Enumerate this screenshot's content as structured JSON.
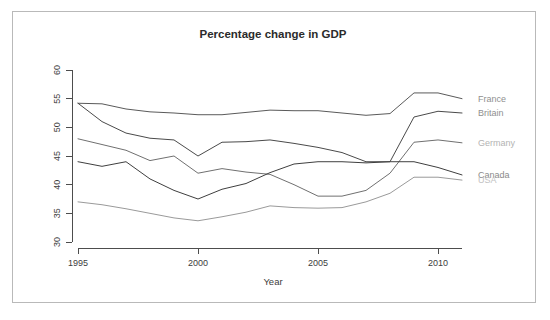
{
  "figure": {
    "background_color": "#ffffff",
    "frame_color": "#b9b9b9",
    "axis_color": "#4d4d4d"
  },
  "chart_data": {
    "type": "line",
    "title": "Percentage change in GDP",
    "xlabel": "Year",
    "ylabel": "",
    "xlim": [
      1995,
      2011
    ],
    "ylim": [
      29,
      61
    ],
    "xticks": [
      1995,
      2000,
      2005,
      2010
    ],
    "yticks": [
      30,
      35,
      40,
      45,
      50,
      55,
      60
    ],
    "grid": false,
    "legend_position": "right-inline",
    "x": [
      1995,
      1996,
      1997,
      1998,
      1999,
      2000,
      2001,
      2002,
      2003,
      2004,
      2005,
      2006,
      2007,
      2008,
      2009,
      2010,
      2011
    ],
    "series": [
      {
        "name": "France",
        "color": "#5a5a5a",
        "label_color": "#8f8f8f",
        "values": [
          54.2,
          54.1,
          53.2,
          52.7,
          52.5,
          52.2,
          52.2,
          52.6,
          53.0,
          52.9,
          52.9,
          52.5,
          52.1,
          52.4,
          56.0,
          56.0,
          55.0
        ]
      },
      {
        "name": "Britain",
        "color": "#4a4a4a",
        "label_color": "#8f8f8f",
        "values": [
          54.2,
          51.0,
          49.0,
          48.1,
          47.8,
          45.0,
          47.4,
          47.5,
          47.8,
          47.2,
          46.5,
          45.6,
          44.0,
          44.0,
          51.8,
          52.8,
          52.5
        ]
      },
      {
        "name": "Germany",
        "color": "#707070",
        "label_color": "#b3b3b3",
        "values": [
          48.0,
          47.0,
          46.0,
          44.2,
          45.0,
          42.0,
          42.8,
          42.2,
          41.8,
          40.0,
          38.0,
          38.0,
          39.0,
          42.0,
          47.4,
          47.8,
          47.3
        ]
      },
      {
        "name": "Canada",
        "color": "#3f3f3f",
        "label_color": "#8a8a8a",
        "values": [
          44.0,
          43.2,
          44.0,
          41.0,
          39.0,
          37.5,
          39.2,
          40.2,
          42.1,
          43.6,
          44.0,
          44.0,
          43.8,
          44.0,
          44.0,
          43.0,
          41.7
        ]
      },
      {
        "name": "USA",
        "color": "#9a9a9a",
        "label_color": "#c2c2c2",
        "values": [
          37.0,
          36.5,
          35.8,
          35.0,
          34.2,
          33.7,
          34.4,
          35.2,
          36.3,
          36.0,
          35.9,
          36.0,
          37.0,
          38.5,
          41.3,
          41.3,
          40.8
        ]
      }
    ],
    "legend_entries": [
      {
        "label": "France",
        "y_value": 55.0
      },
      {
        "label": "Britain",
        "y_value": 52.5
      },
      {
        "label": "Germany",
        "y_value": 47.3
      },
      {
        "label": "Canada",
        "y_value": 41.7
      },
      {
        "label": "USA",
        "y_value": 40.8
      }
    ]
  }
}
